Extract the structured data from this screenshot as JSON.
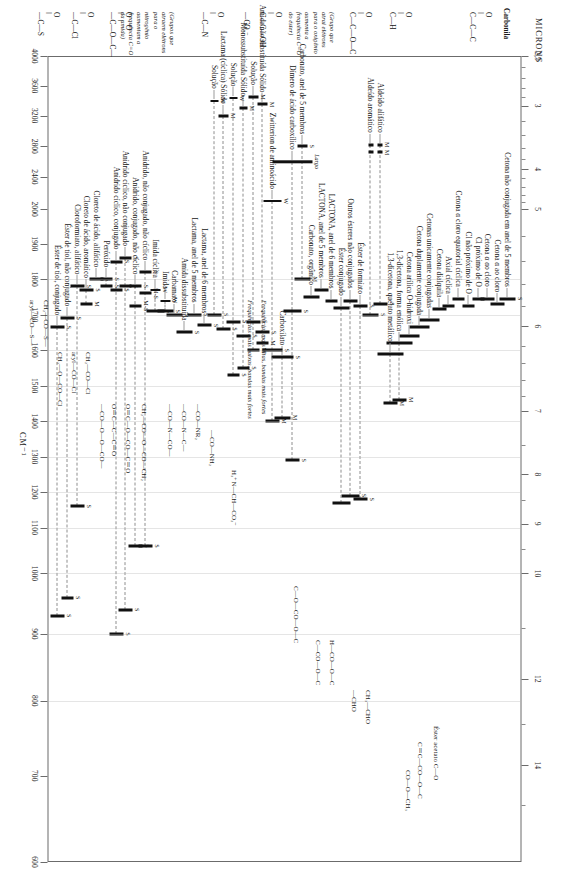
{
  "figure": {
    "kind": "ir-carbonyl-correlation-chart",
    "top_axis_title": "MICRONS",
    "bottom_axis_title": "CM⁻¹",
    "top_axis_ticks": [
      "2,5",
      "3",
      "4",
      "5",
      "6",
      "7",
      "8",
      "9",
      "10",
      "12",
      "14"
    ],
    "bottom_axis_ticks": [
      "4000",
      "3600",
      "3200",
      "2800",
      "2400",
      "2000",
      "1900",
      "1800",
      "1700",
      "1600",
      "1500",
      "1400",
      "1300",
      "1200",
      "1100",
      "1000",
      "900",
      "800",
      "700",
      "600"
    ],
    "section_title": "Carbonila",
    "intensity_codes": [
      "M",
      "S",
      "W",
      "M-S",
      "Largo"
    ]
  },
  "structures": {
    "ketone": "O‖\nC—C—C",
    "aldehyde": "O‖\nC—H",
    "ester": "O‖\nC—C—O—C",
    "acid": "O‖\nC—C—OH",
    "carboxylate": "—CO₂⁻",
    "amide": "O‖\n—C—N",
    "anhydride": "O   O\n—C—O—C—",
    "acid_halide": "O‖\n—C—Cl",
    "thiol_ester": "O‖\n—C—S",
    "ester_note": "(Grupo que atrai elétrons para o oxigênio aumenta a frequência C=O do éster)",
    "amide_note": "(Grupos que atraem elétrons para o nitrogênio aumentam a frequência C=O da amida)",
    "zwitterion": "H₃⁺N—CH—CO₂⁻",
    "acetate": "Éster acetato  C—O",
    "aliph_ald": "CH₃—CHO",
    "arom_ald": "—CHO",
    "formate": "H—CO—O—C",
    "other_ester": "C—CO—O—C",
    "carbonate": "C—O—CO—O—C",
    "unsat_ester": "C＝C—CO—O—C",
    "arom_ester": "CO—O—CH₃",
    "amide_sub": "—CO—NH₂",
    "disub_amide": "—CO—NR₂",
    "carbamate": "—CO—N—C—",
    "imide": "—CO—N—CO—",
    "anhyd_a": "CH₂—CO—O—CO—CH₂",
    "anhyd_b": "O＝C—O—CO—C＝O",
    "anhyd_c": "O＝C—C—C＝O",
    "peroxide": "—CO—O—O—CO—",
    "chl_a": "CH₂—CO—Cl",
    "chl_b": "aryl—CO—Cl",
    "chl_c": "CH₂—O—CO—Cl",
    "thio_a": "CH₂—CO—S—",
    "thio_b": "aryl—CO—S—"
  },
  "chart_data": {
    "type": "bar",
    "xlabel_top": "MICRONS",
    "xlabel_bottom": "CM⁻¹",
    "x_unit": "cm-1",
    "xlim": [
      4000,
      600
    ],
    "grid": true,
    "legend": "none",
    "rows": [
      {
        "group": "Cetona",
        "label": "Cetona não conjugada em anel de 5 membros",
        "bands": [
          {
            "cm": 1745,
            "w": 16,
            "i": "S"
          }
        ]
      },
      {
        "group": "Cetona",
        "label": "Cetona α ao cloro",
        "bands": [
          {
            "cm": 1730,
            "w": 14,
            "i": ""
          }
        ]
      },
      {
        "group": "Cetona",
        "label": "Cetona α αo cloro",
        "bands": [
          {
            "cm": 1745,
            "w": 14,
            "i": ""
          }
        ]
      },
      {
        "group": "Cetona",
        "label": "Cl próximo de O",
        "bands": [
          {
            "cm": 1745,
            "w": 12,
            "i": ""
          }
        ]
      },
      {
        "group": "Cetona",
        "label": "Cl não próximo de O",
        "bands": [
          {
            "cm": 1725,
            "w": 12,
            "i": ""
          }
        ]
      },
      {
        "group": "Cetona",
        "label": "Cetona α cloro  equatorial cíclica",
        "bands": [
          {
            "cm": 1745,
            "w": 12,
            "i": ""
          }
        ]
      },
      {
        "group": "Cetona",
        "label": "Axial cíclica",
        "bands": [
          {
            "cm": 1725,
            "w": 12,
            "i": ""
          }
        ]
      },
      {
        "group": "Cetona",
        "label": "Cetona dialquila",
        "bands": [
          {
            "cm": 1715,
            "w": 14,
            "i": ""
          }
        ]
      },
      {
        "group": "Cetona",
        "label": "Cetonas unicamente conjugadas",
        "bands": [
          {
            "cm": 1685,
            "w": 20,
            "i": ""
          }
        ]
      },
      {
        "group": "Cetona",
        "label": "Cetona duplamente conjugada",
        "bands": [
          {
            "cm": 1665,
            "w": 20,
            "i": ""
          }
        ]
      },
      {
        "group": "Cetona",
        "label": "Cetona arílica O-hidroxi",
        "bands": [
          {
            "cm": 1640,
            "w": 20,
            "i": ""
          }
        ]
      },
      {
        "group": "Cetona",
        "label": "1,3-dicetona, forma enólica",
        "bands": [
          {
            "cm": 1620,
            "w": 26,
            "i": ""
          },
          {
            "cm": 1460,
            "w": 14,
            "i": "M"
          }
        ]
      },
      {
        "group": "Cetona",
        "label": "1,3-dicetona, quelato metálico",
        "bands": [
          {
            "cm": 1590,
            "w": 26,
            "i": ""
          },
          {
            "cm": 1450,
            "w": 14,
            "i": "M"
          }
        ]
      },
      {
        "group": "Aldeído",
        "label": "Aldeído alifático",
        "bands": [
          {
            "cm": 1730,
            "w": 14,
            "i": "S"
          },
          {
            "cm": 2720,
            "w": 5,
            "i": "M"
          },
          {
            "cm": 2820,
            "w": 5,
            "i": "M"
          }
        ]
      },
      {
        "group": "Aldeído",
        "label": "Aldeído aromático",
        "bands": [
          {
            "cm": 1700,
            "w": 16,
            "i": "S"
          },
          {
            "cm": 2720,
            "w": 5,
            "i": ""
          },
          {
            "cm": 2820,
            "w": 5,
            "i": ""
          }
        ]
      },
      {
        "group": "Éster",
        "label": "Éster de formiato",
        "bands": [
          {
            "cm": 1725,
            "w": 14,
            "i": "S"
          },
          {
            "cm": 1180,
            "w": 14,
            "i": "S"
          }
        ]
      },
      {
        "group": "Éster",
        "label": "Outros ésteres não conjugados",
        "bands": [
          {
            "cm": 1740,
            "w": 14,
            "i": ""
          },
          {
            "cm": 1190,
            "w": 18,
            "i": "S"
          }
        ]
      },
      {
        "group": "Éster",
        "label": "Éster conjugado",
        "bands": [
          {
            "cm": 1720,
            "w": 16,
            "i": ""
          },
          {
            "cm": 1170,
            "w": 18,
            "i": ""
          }
        ]
      },
      {
        "group": "Éster",
        "label": "LACTONA, anel de 6 membros",
        "bands": [
          {
            "cm": 1740,
            "w": 12,
            "i": ""
          }
        ]
      },
      {
        "group": "Éster",
        "label": "LACTONA, anel de 5 membros",
        "bands": [
          {
            "cm": 1770,
            "w": 14,
            "i": ""
          }
        ]
      },
      {
        "group": "Éster",
        "label": "Carbonato, orgânico",
        "bands": [
          {
            "cm": 1750,
            "w": 16,
            "i": ""
          }
        ]
      },
      {
        "group": "Éster",
        "label": "Carbonato, anel de 5 membros",
        "bands": [
          {
            "cm": 1800,
            "w": 16,
            "i": "M"
          },
          {
            "cm": 2800,
            "w": 10,
            "i": "S"
          }
        ]
      },
      {
        "group": "Ácido",
        "label": "Dímero de ácido carboxílico",
        "bands": [
          {
            "cm": 1710,
            "w": 18,
            "i": "S"
          },
          {
            "cm": 1290,
            "w": 14,
            "i": "S"
          },
          {
            "cm": 2600,
            "w": 40,
            "i": "Largo"
          }
        ]
      },
      {
        "group": "Ácido",
        "label": "Carboxilato",
        "bands": [
          {
            "cm": 1580,
            "w": 22,
            "i": "S"
          },
          {
            "cm": 1410,
            "w": 16,
            "i": "M"
          }
        ]
      },
      {
        "group": "Ácido",
        "label": "Zwitterion de aminoácido",
        "bands": [
          {
            "cm": 1600,
            "w": 20,
            "i": "S"
          },
          {
            "cm": 1400,
            "w": 14,
            "i": "M"
          },
          {
            "cm": 2100,
            "w": 18,
            "i": "W"
          }
        ]
      },
      {
        "group": "Amida",
        "label": "Amida não substituída   Sólido",
        "bands": [
          {
            "cm": 1650,
            "w": 14,
            "i": "S"
          },
          {
            "cm": 1620,
            "w": 12,
            "i": "M"
          },
          {
            "cm": 3350,
            "w": 10,
            "i": "M"
          }
        ]
      },
      {
        "group": "Amida",
        "label": "Solução",
        "bands": [
          {
            "cm": 1680,
            "w": 14,
            "i": "S"
          },
          {
            "cm": 1600,
            "w": 12,
            "i": "M"
          },
          {
            "cm": 3450,
            "w": 10,
            "i": "M"
          }
        ]
      },
      {
        "group": "Amida",
        "label": "Monossubstituída   Sólido",
        "bands": [
          {
            "cm": 1640,
            "w": 14,
            "i": "S"
          },
          {
            "cm": 1550,
            "w": 12,
            "i": "S"
          },
          {
            "cm": 3300,
            "w": 8,
            "i": "M"
          }
        ]
      },
      {
        "group": "Amida",
        "label": "Solução",
        "bands": [
          {
            "cm": 1680,
            "w": 14,
            "i": "S"
          },
          {
            "cm": 1530,
            "w": 12,
            "i": "S"
          },
          {
            "cm": 3430,
            "w": 8,
            "i": "W"
          }
        ]
      },
      {
        "group": "Amida",
        "label": "Lactama (cíclica)   Sólido",
        "bands": [
          {
            "cm": 1660,
            "w": 14,
            "i": "S"
          },
          {
            "cm": 3200,
            "w": 10,
            "i": "M"
          }
        ]
      },
      {
        "group": "Amida",
        "label": "Solução",
        "bands": [
          {
            "cm": 1700,
            "w": 14,
            "i": "S"
          },
          {
            "cm": 3400,
            "w": 8,
            "i": "W"
          }
        ]
      },
      {
        "group": "Amida",
        "label": "Lactama, anel de 6 membros",
        "bands": [
          {
            "cm": 1670,
            "w": 14,
            "i": "S"
          }
        ]
      },
      {
        "group": "Amida",
        "label": "Lactama, anel de 5 membros",
        "bands": [
          {
            "cm": 1700,
            "w": 14,
            "i": "S"
          }
        ]
      },
      {
        "group": "Amida",
        "label": "Amida dissubstituída",
        "bands": [
          {
            "cm": 1650,
            "w": 16,
            "i": "S"
          }
        ]
      },
      {
        "group": "Amida",
        "label": "Carbamato",
        "bands": [
          {
            "cm": 1700,
            "w": 16,
            "i": "S"
          }
        ]
      },
      {
        "group": "Amida",
        "label": "Imida",
        "bands": [
          {
            "cm": 1710,
            "w": 16,
            "i": "S"
          },
          {
            "cm": 1740,
            "w": 10,
            "i": "W"
          }
        ]
      },
      {
        "group": "Amida",
        "label": "Imida cíclica",
        "bands": [
          {
            "cm": 1710,
            "w": 18,
            "i": "S"
          },
          {
            "cm": 1770,
            "w": 10,
            "i": "W"
          }
        ]
      },
      {
        "group": "Anidrido",
        "label": "Anidrido, não conjugado, não cíclico",
        "bands": [
          {
            "cm": 1820,
            "w": 12,
            "i": "S"
          },
          {
            "cm": 1760,
            "w": 12,
            "i": "M-S"
          },
          {
            "cm": 1060,
            "w": 14,
            "i": "S"
          }
        ]
      },
      {
        "group": "Anidrido",
        "label": "Anidrido, conjugado, não cíclico",
        "bands": [
          {
            "cm": 1780,
            "w": 12,
            "i": "S"
          },
          {
            "cm": 1725,
            "w": 12,
            "i": "M-S"
          },
          {
            "cm": 1060,
            "w": 14,
            "i": "S"
          }
        ]
      },
      {
        "group": "Anidrido",
        "label": "Anidrido cíclico, não conjugado",
        "bands": [
          {
            "cm": 1860,
            "w": 12,
            "i": "S"
          },
          {
            "cm": 1780,
            "w": 12,
            "i": "S"
          },
          {
            "cm": 940,
            "w": 14,
            "i": "S"
          }
        ]
      },
      {
        "group": "Anidrido",
        "label": "Anidrido cíclico, conjugado",
        "bands": [
          {
            "cm": 1850,
            "w": 12,
            "i": "S"
          },
          {
            "cm": 1770,
            "w": 12,
            "i": "S"
          },
          {
            "cm": 900,
            "w": 14,
            "i": "S"
          }
        ]
      },
      {
        "group": "Anidrido",
        "label": "Peróxido",
        "bands": [
          {
            "cm": 1800,
            "w": 12,
            "i": "S"
          },
          {
            "cm": 1780,
            "w": 12,
            "i": "S"
          }
        ]
      },
      {
        "group": "Haleto",
        "label": "Cloreto de ácido, alifático",
        "bands": [
          {
            "cm": 1800,
            "w": 14,
            "i": "S"
          }
        ]
      },
      {
        "group": "Haleto",
        "label": "Cloreto de ácido, aromático",
        "bands": [
          {
            "cm": 1770,
            "w": 14,
            "i": "S"
          },
          {
            "cm": 1730,
            "w": 12,
            "i": "M"
          }
        ]
      },
      {
        "group": "Haleto",
        "label": "Cloroformiato, alifático",
        "bands": [
          {
            "cm": 1780,
            "w": 14,
            "i": "S"
          },
          {
            "cm": 1160,
            "w": 14,
            "i": "S"
          }
        ]
      },
      {
        "group": "Tioléster",
        "label": "Éster de tiol, não conjugado",
        "bands": [
          {
            "cm": 1690,
            "w": 14,
            "i": "S"
          },
          {
            "cm": 960,
            "w": 12,
            "i": "S"
          }
        ]
      },
      {
        "group": "Tioléster",
        "label": "Éster de tiol, conjugado",
        "bands": [
          {
            "cm": 1665,
            "w": 14,
            "i": "S"
          },
          {
            "cm": 930,
            "w": 14,
            "i": "S"
          }
        ]
      }
    ],
    "annotations": [
      {
        "text": "Frequências mais altas, bandas mais fortes",
        "italic": true
      },
      {
        "text": "Frequências mais baixas, bandas mais fortes",
        "italic": true
      },
      {
        "text": "Largo",
        "italic": true
      },
      {
        "text": "Sólido",
        "italic": true
      },
      {
        "text": "Solução",
        "italic": true
      }
    ]
  }
}
